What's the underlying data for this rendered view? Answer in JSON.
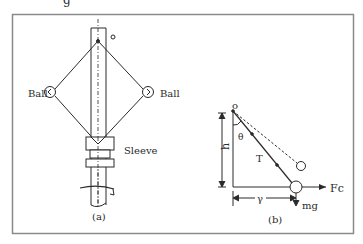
{
  "top_fragment": "g",
  "figure_a": {
    "caption": "(a)",
    "left_ball_label": "Ball",
    "right_ball_label": "Ball",
    "sleeve_label": "Sleeve",
    "pivot_label": "o"
  },
  "figure_b": {
    "caption": "(b)",
    "origin_label": "o",
    "angle_label": "θ",
    "height_label": "h",
    "tension_label": "T",
    "radius_label": "γ",
    "force_label": "Fc",
    "weight_label": "mg"
  },
  "colors": {
    "frame": "#8a8a8a",
    "ink": "#2a2a2a"
  }
}
